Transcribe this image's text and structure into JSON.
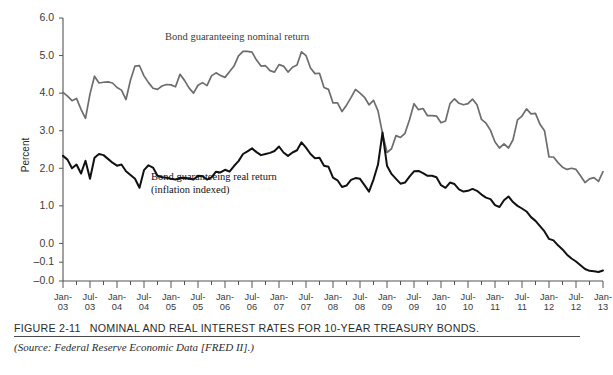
{
  "figure": {
    "number": "FIGURE 2-11",
    "caption": "NOMINAL AND REAL INTEREST RATES FOR 10-YEAR TREASURY BONDS.",
    "source": "(Source: Federal Reserve Economic Data [FRED II].)"
  },
  "colors": {
    "nominal_line": "#6d6d6d",
    "real_line": "#111111",
    "axis": "#555555",
    "text": "#2b2b2b",
    "background": "#ffffff"
  },
  "annotations": {
    "nominal": "Bond guaranteeing nominal return",
    "real_line1": "Bond guaranteeing real return",
    "real_line2": "(inflation indexed)"
  },
  "chart_data": {
    "type": "line",
    "title": "NOMINAL AND REAL INTEREST RATES FOR 10-YEAR TREASURY BONDS.",
    "xlabel": "",
    "ylabel": "Percent",
    "grid": false,
    "legend_position": "inline-annotation",
    "ylim": [
      -1.0,
      6.0
    ],
    "ytick_labels": [
      "6.0",
      "5.0",
      "4.0",
      "3.0",
      "2.0",
      "1.0",
      "0.0",
      "-0.1",
      "-0.0"
    ],
    "ytick_values": [
      6.0,
      5.0,
      4.0,
      3.0,
      2.0,
      1.0,
      0.0,
      -0.5,
      -1.0
    ],
    "xtick_labels": [
      "Jan-\n03",
      "Jul-\n03",
      "Jan-\n04",
      "Jul-\n04",
      "Jan-\n05",
      "Jul-\n05",
      "Jan-\n06",
      "Jul-\n06",
      "Jan-\n07",
      "Jul-\n07",
      "Jan-\n08",
      "Jul-\n08",
      "Jan-\n09",
      "Jul-\n09",
      "Jan-\n10",
      "Jul-\n10",
      "Jan-\n11",
      "Jul-\n11",
      "Jan-\n12",
      "Jul-\n12",
      "Jan-\n13"
    ],
    "xtick_months": [
      "Jan-",
      "Jul-",
      "Jan-",
      "Jul-",
      "Jan-",
      "Jul-",
      "Jan-",
      "Jul-",
      "Jan-",
      "Jul-",
      "Jan-",
      "Jul-",
      "Jan-",
      "Jul-",
      "Jan-",
      "Jul-",
      "Jan-",
      "Jul-",
      "Jan-",
      "Jul-",
      "Jan-"
    ],
    "xtick_years": [
      "03",
      "03",
      "04",
      "04",
      "05",
      "05",
      "06",
      "06",
      "07",
      "07",
      "08",
      "08",
      "09",
      "09",
      "10",
      "10",
      "11",
      "11",
      "12",
      "12",
      "13"
    ],
    "x_start": "Jan-03",
    "x_end": "Jan-13",
    "x_index_range": [
      0,
      120
    ],
    "series": [
      {
        "name": "Bond guaranteeing nominal return",
        "color": "#6d6d6d",
        "values": [
          4.02,
          3.92,
          3.8,
          3.86,
          3.57,
          3.33,
          3.98,
          4.45,
          4.27,
          4.29,
          4.3,
          4.27,
          4.15,
          4.08,
          3.83,
          4.35,
          4.72,
          4.73,
          4.46,
          4.28,
          4.13,
          4.1,
          4.19,
          4.23,
          4.22,
          4.17,
          4.5,
          4.34,
          4.14,
          4.0,
          4.21,
          4.28,
          4.2,
          4.46,
          4.54,
          4.47,
          4.42,
          4.57,
          4.72,
          4.99,
          5.11,
          5.11,
          5.09,
          4.88,
          4.72,
          4.73,
          4.6,
          4.56,
          4.76,
          4.72,
          4.56,
          4.69,
          4.75,
          5.1,
          5.0,
          4.67,
          4.52,
          4.53,
          4.15,
          4.1,
          3.74,
          3.74,
          3.51,
          3.68,
          3.88,
          4.1,
          4.0,
          3.89,
          3.69,
          3.81,
          3.53,
          2.93,
          2.42,
          2.52,
          2.87,
          2.82,
          2.93,
          3.29,
          3.72,
          3.56,
          3.59,
          3.4,
          3.4,
          3.39,
          3.21,
          3.26,
          3.72,
          3.85,
          3.73,
          3.69,
          3.72,
          3.84,
          3.69,
          3.3,
          3.2,
          3.01,
          2.7,
          2.54,
          2.65,
          2.54,
          2.76,
          3.29,
          3.39,
          3.58,
          3.45,
          3.46,
          3.17,
          3.0,
          2.3,
          2.3,
          2.15,
          2.03,
          1.97,
          2.0,
          1.97,
          1.8,
          1.62,
          1.72,
          1.75,
          1.65,
          1.91
        ]
      },
      {
        "name": "Bond guaranteeing real return (inflation indexed)",
        "color": "#111111",
        "values": [
          2.33,
          2.23,
          2.0,
          2.1,
          1.86,
          2.2,
          1.72,
          2.28,
          2.38,
          2.35,
          2.25,
          2.15,
          2.07,
          2.1,
          1.92,
          1.82,
          1.72,
          1.48,
          1.95,
          2.08,
          2.02,
          1.8,
          1.76,
          1.75,
          1.72,
          1.7,
          1.74,
          1.75,
          1.73,
          1.7,
          1.8,
          1.79,
          1.7,
          1.76,
          1.91,
          1.89,
          1.96,
          1.91,
          2.06,
          2.19,
          2.38,
          2.45,
          2.53,
          2.43,
          2.35,
          2.38,
          2.41,
          2.46,
          2.58,
          2.42,
          2.33,
          2.42,
          2.48,
          2.69,
          2.55,
          2.38,
          2.27,
          2.28,
          2.07,
          2.04,
          1.75,
          1.68,
          1.5,
          1.54,
          1.69,
          1.74,
          1.72,
          1.55,
          1.38,
          1.7,
          2.1,
          2.95,
          2.07,
          1.85,
          1.72,
          1.59,
          1.62,
          1.78,
          1.92,
          1.93,
          1.87,
          1.8,
          1.8,
          1.76,
          1.55,
          1.48,
          1.62,
          1.58,
          1.44,
          1.38,
          1.4,
          1.45,
          1.4,
          1.3,
          1.22,
          1.18,
          1.02,
          0.97,
          1.15,
          1.25,
          1.1,
          1.0,
          0.93,
          0.85,
          0.7,
          0.6,
          0.46,
          0.32,
          0.12,
          0.08,
          -0.05,
          -0.16,
          -0.3,
          -0.4,
          -0.48,
          -0.58,
          -0.68,
          -0.73,
          -0.74,
          -0.76,
          -0.72
        ]
      }
    ]
  }
}
